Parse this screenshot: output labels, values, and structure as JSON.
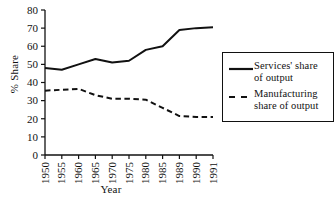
{
  "chart_data": {
    "type": "line",
    "title": "",
    "xlabel": "Year",
    "ylabel": "% Share",
    "categories": [
      "1950",
      "1955",
      "1960",
      "1965",
      "1970",
      "1975",
      "1980",
      "1985",
      "1989",
      "1990",
      "1991"
    ],
    "ylim": [
      0,
      80
    ],
    "yticks": [
      0,
      10,
      20,
      30,
      40,
      50,
      60,
      70,
      80
    ],
    "grid": false,
    "legend_position": "right",
    "series": [
      {
        "name": "Services' share of output",
        "style": "solid",
        "color": "#111111",
        "values": [
          48,
          47,
          50,
          53,
          51,
          52,
          58,
          60,
          69,
          70,
          70.5
        ]
      },
      {
        "name": "Manufacturing share of output",
        "style": "dashed",
        "color": "#111111",
        "values": [
          35.5,
          36,
          36.5,
          33,
          31,
          31,
          30.5,
          26,
          21.5,
          21,
          21
        ]
      }
    ]
  },
  "legend": {
    "entries": [
      {
        "label_line1": "Services' share",
        "label_line2": "of output"
      },
      {
        "label_line1": "Manufacturing",
        "label_line2": "share of output"
      }
    ]
  }
}
